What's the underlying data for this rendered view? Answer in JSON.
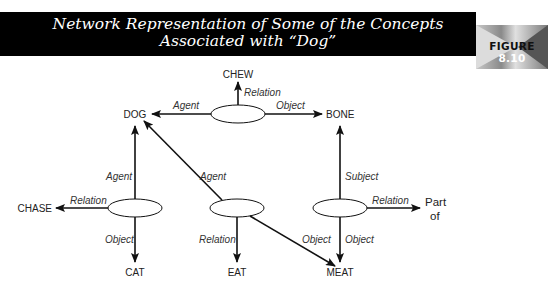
{
  "header": {
    "title_line1": "Network Representation of Some of the Concepts",
    "title_line2": "Associated with “Dog”",
    "figure_word": "FIGURE",
    "figure_number": "8.10"
  },
  "nodes": {
    "chew": "CHEW",
    "dog": "DOG",
    "bone": "BONE",
    "chase": "CHASE",
    "cat": "CAT",
    "eat": "EAT",
    "meat": "MEAT",
    "part_of_line1": "Part",
    "part_of_line2": "of"
  },
  "edges": {
    "top_relation": "Relation",
    "top_agent": "Agent",
    "top_object": "Object",
    "left_agent": "Agent",
    "left_relation": "Relation",
    "left_object": "Object",
    "mid_agent": "Agent",
    "mid_relation": "Relation",
    "mid_object": "Object",
    "right_subject": "Subject",
    "right_relation": "Relation",
    "right_object": "Object"
  }
}
